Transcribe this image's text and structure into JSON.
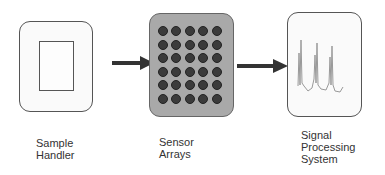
{
  "diagram": {
    "type": "block flow diagram",
    "blocks": [
      {
        "id": "sample-handler",
        "label_lines": [
          "Sample",
          "Handler"
        ]
      },
      {
        "id": "sensor-arrays",
        "label_lines": [
          "Sensor",
          "Arrays"
        ],
        "grid": {
          "rows": 6,
          "cols": 5
        }
      },
      {
        "id": "signal-processing-system",
        "label_lines": [
          "Signal",
          "Processing",
          "System"
        ]
      }
    ],
    "edges": [
      {
        "from": "sample-handler",
        "to": "sensor-arrays"
      },
      {
        "from": "sensor-arrays",
        "to": "signal-processing-system"
      }
    ],
    "colors": {
      "sensor_fill": "#a9a9a9",
      "dot_fill": "#3b3b3b",
      "arrow": "#333333",
      "signal_trace": "#999999"
    }
  },
  "labels": {
    "sample": [
      "Sample",
      "Handler"
    ],
    "sensor": [
      "Sensor",
      "Arrays"
    ],
    "signal": [
      "Signal",
      "Processing",
      "System"
    ]
  }
}
